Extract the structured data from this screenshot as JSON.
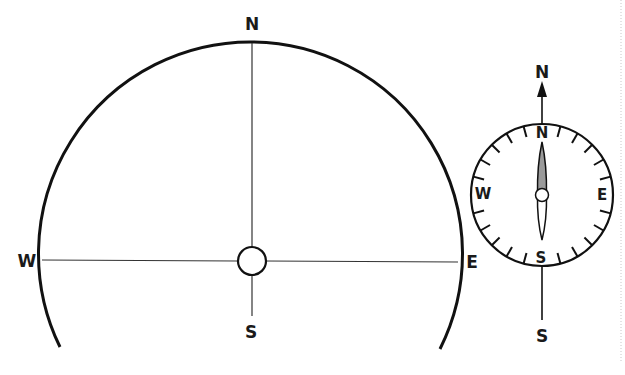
{
  "sky_diagram": {
    "labels": {
      "north": "N",
      "south": "S",
      "east": "E",
      "west": "W"
    },
    "arc_color": "#111111",
    "line_color": "#333333"
  },
  "compass": {
    "direction_labels": {
      "north_outer": "N",
      "south_outer": "S",
      "north": "N",
      "south": "S",
      "east": "E",
      "west": "W"
    },
    "tick_interval_degrees": 15,
    "needle_north_color": "#9a9a9a",
    "needle_south_color": "#ffffff"
  }
}
